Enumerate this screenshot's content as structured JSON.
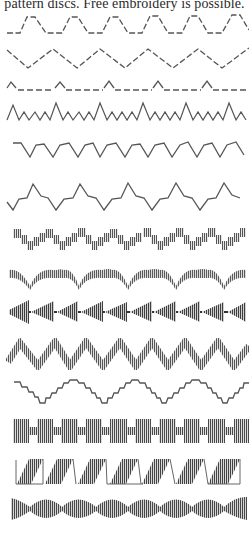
{
  "page": {
    "caption": "pattern discs. Free embroidery is possible."
  },
  "stitch_samples": [
    {
      "id": 1,
      "name": "dashed trapezoid wave"
    },
    {
      "id": 2,
      "name": "dashed zigzag"
    },
    {
      "id": 3,
      "name": "dashed line with peaks"
    },
    {
      "id": 4,
      "name": "alternating small and large zigzag"
    },
    {
      "id": 5,
      "name": "v-dip wave"
    },
    {
      "id": 6,
      "name": "peaked step wave"
    },
    {
      "id": 7,
      "name": "stepped satin blocks"
    },
    {
      "id": 8,
      "name": "satin scallops"
    },
    {
      "id": 9,
      "name": "satin triangles"
    },
    {
      "id": 10,
      "name": "satin zigzag"
    },
    {
      "id": 11,
      "name": "stepped wave"
    },
    {
      "id": 12,
      "name": "satin bar blocks"
    },
    {
      "id": 13,
      "name": "satin parallelograms"
    },
    {
      "id": 14,
      "name": "satin ovals"
    }
  ],
  "colors": {
    "ink": "#555555",
    "ink_dark": "#333333",
    "paper": "#ffffff"
  }
}
